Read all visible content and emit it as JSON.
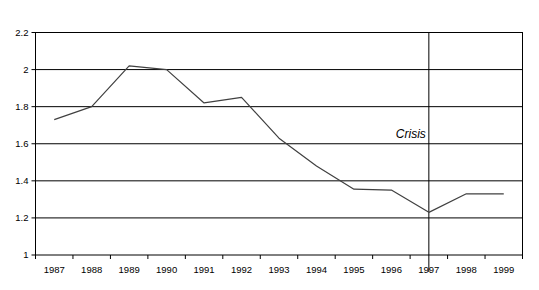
{
  "chart_data": {
    "type": "line",
    "title": "",
    "subtitle": "",
    "xlabel": "",
    "ylabel": "",
    "categories": [
      "1987",
      "1988",
      "1989",
      "1990",
      "1991",
      "1992",
      "1993",
      "1994",
      "1995",
      "1996",
      "1997",
      "1998",
      "1999"
    ],
    "series": [
      {
        "name": "",
        "values": [
          1.73,
          1.8,
          2.02,
          2.0,
          1.82,
          1.85,
          1.63,
          1.48,
          1.355,
          1.35,
          1.23,
          1.33,
          1.33
        ]
      }
    ],
    "ylim": [
      1,
      2.2
    ],
    "yticks": [
      1,
      1.2,
      1.4,
      1.6,
      1.8,
      2,
      2.2
    ],
    "ytick_labels": [
      "1",
      "1.2",
      "1.4",
      "1.6",
      "1.8",
      "2",
      "2.2"
    ],
    "grid": "horizontal",
    "legend": "none",
    "series_color": "#404040",
    "axis_color": "#000000",
    "grid_color": "#000000",
    "background": "#ffffff",
    "annotations": [
      {
        "label": "Crisis",
        "category": "1997",
        "style": "italic",
        "marker": "vertical-line"
      }
    ]
  }
}
